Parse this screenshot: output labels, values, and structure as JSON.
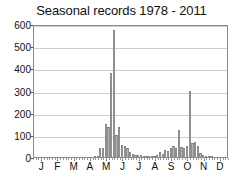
{
  "chart_data": {
    "type": "bar",
    "title": "Seasonal records 1978 - 2011",
    "xlabel": "",
    "ylabel": "",
    "ylim": [
      0,
      600
    ],
    "yticks": [
      0,
      100,
      200,
      300,
      400,
      500,
      600
    ],
    "grid": true,
    "legend": "none",
    "xtick_labels": [
      "J",
      "F",
      "M",
      "A",
      "M",
      "J",
      "J",
      "A",
      "S",
      "O",
      "N",
      "D"
    ],
    "x_bin_description": "pentads (5-day periods) across the calendar year",
    "series": [
      {
        "name": "records",
        "values": [
          0,
          0,
          0,
          0,
          0,
          0,
          0,
          0,
          0,
          0,
          0,
          0,
          0,
          0,
          0,
          0,
          0,
          0,
          0,
          0,
          0,
          0,
          3,
          5,
          42,
          40,
          150,
          135,
          380,
          575,
          100,
          135,
          55,
          48,
          40,
          22,
          12,
          10,
          8,
          10,
          5,
          4,
          3,
          4,
          6,
          8,
          22,
          15,
          30,
          28,
          42,
          50,
          42,
          120,
          45,
          42,
          48,
          300,
          62,
          68,
          50,
          20,
          8,
          4,
          2,
          1,
          0,
          0,
          0,
          0,
          0,
          0
        ]
      }
    ],
    "peak_annotations": [
      {
        "label": "May peak",
        "value": 575
      },
      {
        "label": "Sep-Oct peak",
        "value": 300
      }
    ],
    "colors": {
      "bar_fill": "#b4b4b4",
      "bar_edge": "#8f8f8f",
      "grid": "#cfcfcf",
      "axis": "#8a8a8a",
      "text": "#111111",
      "background": "#ffffff"
    }
  }
}
